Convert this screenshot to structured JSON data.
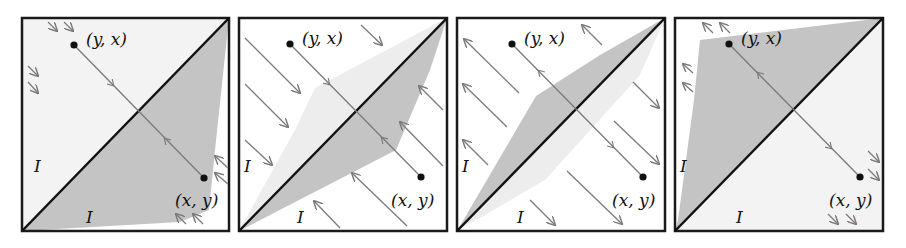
{
  "figure": {
    "panel_count": 4,
    "colors": {
      "frame": "#1a1a1a",
      "diagonal": "#111111",
      "shade_dark": "#bdbdbd",
      "shade_light": "#ececec",
      "arrow": "#7a7a7a",
      "point": "#111111"
    }
  },
  "panels": [
    {
      "index": 1,
      "point_upper": "(y, x)",
      "point_lower": "(x, y)",
      "region_upper": "I",
      "region_lower": "I",
      "flow": "inward to shaded lower region"
    },
    {
      "index": 2,
      "point_upper": "(y, x)",
      "point_lower": "(x, y)",
      "region_upper": "I",
      "region_lower": "I",
      "flow": "toward diagonal from both sides"
    },
    {
      "index": 3,
      "point_upper": "(y, x)",
      "point_lower": "(x, y)",
      "region_upper": "I",
      "region_lower": "I",
      "flow": "away from diagonal"
    },
    {
      "index": 4,
      "point_upper": "(y, x)",
      "point_lower": "(x, y)",
      "region_upper": "I",
      "region_lower": "I",
      "flow": "outward from shaded upper region"
    }
  ]
}
